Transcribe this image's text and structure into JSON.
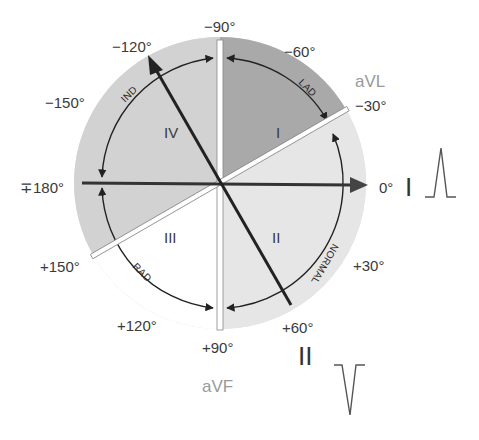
{
  "diagram": {
    "colors": {
      "outer_disk": "#d9d9d9",
      "quadrant_I": "#a9a9a9",
      "quadrant_II": "#e4e4e4",
      "quadrant_III": "#ffffff",
      "quadrant_IV": "#cfcfcf",
      "axis_line": "#222222",
      "lead_bar": "#ffffff",
      "angle_text": "#3a3a3a",
      "lead_text": "#9a9a9a"
    },
    "angle_labels": {
      "m90": "−90°",
      "m60": "−60°",
      "m30": "−30°",
      "zero": "0°",
      "p30": "+30°",
      "p60": "+60°",
      "p90": "+90°",
      "p120": "+120°",
      "p150": "+150°",
      "pm180": "∓180°",
      "m150": "−150°",
      "m120": "−120°"
    },
    "leads": {
      "aVL": "aVL",
      "aVF": "aVF",
      "I": "I",
      "II": "II"
    },
    "quadrants": {
      "I": "I",
      "II": "II",
      "III": "III",
      "IV": "IV"
    },
    "regions": {
      "lad": "LAD",
      "normal": "NORMAL",
      "rad": "RAD",
      "ind": "IND"
    },
    "waveforms": {
      "lead_I": "positive-spike",
      "lead_II": "negative-spike"
    }
  }
}
